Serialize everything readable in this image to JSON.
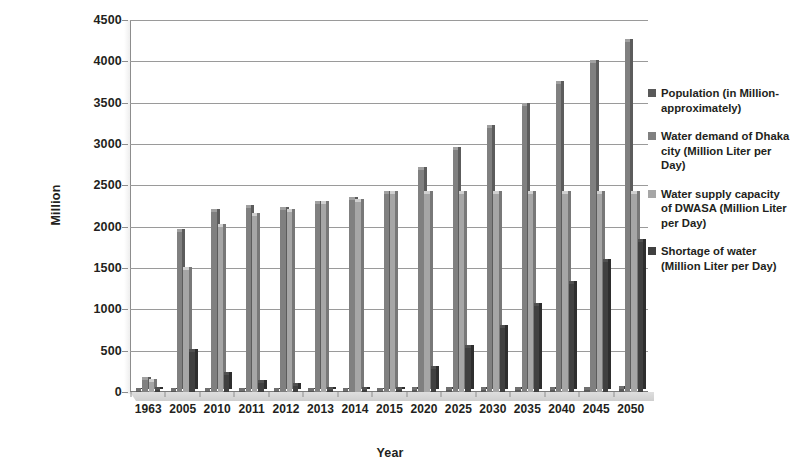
{
  "chart_data": {
    "type": "bar",
    "title": "",
    "xlabel": "Year",
    "ylabel": "Million",
    "ylim": [
      0,
      4500
    ],
    "ytick_values": [
      0,
      500,
      1000,
      1500,
      2000,
      2500,
      3000,
      3500,
      4000,
      4500
    ],
    "ytick_labels": [
      "0",
      "500",
      "1000",
      "1500",
      "2000",
      "2500",
      "3000",
      "3500",
      "4000",
      "4500"
    ],
    "grid": true,
    "legend_position": "right",
    "categories": [
      "1963",
      "2005",
      "2010",
      "2011",
      "2012",
      "2013",
      "2014",
      "2015",
      "2020",
      "2025",
      "2030",
      "2035",
      "2040",
      "2045",
      "2050"
    ],
    "series": [
      {
        "name": "Population (in Million- approximately)",
        "color": "#595959",
        "values": [
          1,
          12,
          13,
          14,
          15,
          15,
          16,
          17,
          19,
          21,
          23,
          25,
          27,
          29,
          31
        ]
      },
      {
        "name": "Water demand of Dhaka city (Million Liter per Day)",
        "color": "#808080",
        "values": [
          150,
          1930,
          2180,
          2230,
          2200,
          2270,
          2320,
          2400,
          2680,
          2930,
          3190,
          3460,
          3720,
          3980,
          4230
        ]
      },
      {
        "name": "Water supply capacity of DWASA (Million Liter per Day)",
        "color": "#a6a6a6",
        "values": [
          120,
          1470,
          2000,
          2130,
          2180,
          2270,
          2300,
          2390,
          2400,
          2400,
          2400,
          2400,
          2400,
          2400,
          2400
        ]
      },
      {
        "name": "Shortage of water (Million Liter per Day)",
        "color": "#404040",
        "values": [
          30,
          490,
          200,
          110,
          70,
          20,
          20,
          20,
          280,
          530,
          780,
          1040,
          1310,
          1570,
          1820
        ]
      }
    ]
  },
  "legend": {
    "items": [
      {
        "swatch_name": "legend-swatch-population",
        "color": "#595959",
        "label": "Population (in Million- approximately)"
      },
      {
        "swatch_name": "legend-swatch-water-demand",
        "color": "#808080",
        "label": "Water demand of Dhaka city (Million Liter per Day)"
      },
      {
        "swatch_name": "legend-swatch-water-supply",
        "color": "#a6a6a6",
        "label": "Water supply capacity of DWASA (Million Liter per Day)"
      },
      {
        "swatch_name": "legend-swatch-shortage",
        "color": "#404040",
        "label": "Shortage of water (Million Liter per Day)"
      }
    ]
  },
  "axis": {
    "y_title": "Million",
    "x_title": "Year"
  }
}
